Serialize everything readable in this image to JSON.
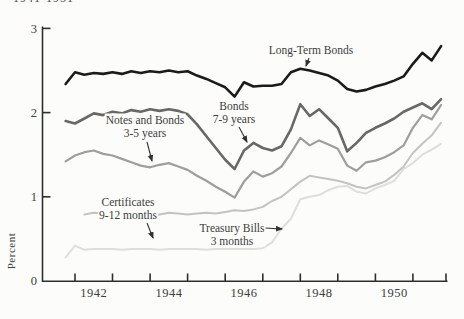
{
  "page": {
    "title_fragment": "1941-1951"
  },
  "chart_data": {
    "type": "line",
    "title": "1941-1951",
    "ylabel": "Percent",
    "ylim": [
      0,
      3
    ],
    "yticks": [
      0,
      1,
      2,
      3
    ],
    "xlim": [
      1941.6,
      1951.93
    ],
    "xticks": [
      1942,
      1943,
      1944,
      1945,
      1946,
      1947,
      1948,
      1949,
      1950,
      1951,
      1951.88
    ],
    "xtick_labels": [
      {
        "label": "1942",
        "center_year": 1942.5
      },
      {
        "label": "1944",
        "center_year": 1944.5
      },
      {
        "label": "1946",
        "center_year": 1946.5
      },
      {
        "label": "1948",
        "center_year": 1948.5
      },
      {
        "label": "1950",
        "center_year": 1950.5
      }
    ],
    "grid": false,
    "legend_position": "inline-annotations",
    "axis_color": "#2e2e2e",
    "series": [
      {
        "name": "Treasury Bills 3 months",
        "color": "#dedede",
        "width": 2.0,
        "x_start": 1941.75,
        "x_step": 0.25,
        "values": [
          0.28,
          0.42,
          0.37,
          0.38,
          0.38,
          0.38,
          0.37,
          0.38,
          0.38,
          0.38,
          0.37,
          0.38,
          0.38,
          0.38,
          0.38,
          0.37,
          0.38,
          0.38,
          0.38,
          0.38,
          0.38,
          0.39,
          0.46,
          0.62,
          0.74,
          0.97,
          1.0,
          1.02,
          1.08,
          1.12,
          1.13,
          1.06,
          1.04,
          1.1,
          1.14,
          1.19,
          1.33,
          1.4,
          1.5,
          1.56,
          1.63
        ]
      },
      {
        "name": "Certificates 9-12 months",
        "color": "#c3c3c3",
        "width": 2.0,
        "x_start": 1942.25,
        "x_step": 0.25,
        "values": [
          0.79,
          0.81,
          0.8,
          0.79,
          0.81,
          0.8,
          0.78,
          0.75,
          0.79,
          0.81,
          0.8,
          0.79,
          0.8,
          0.81,
          0.8,
          0.82,
          0.84,
          0.83,
          0.85,
          0.88,
          0.95,
          1.0,
          1.09,
          1.18,
          1.25,
          1.23,
          1.21,
          1.19,
          1.16,
          1.12,
          1.1,
          1.14,
          1.18,
          1.26,
          1.36,
          1.52,
          1.63,
          1.73,
          1.88
        ]
      },
      {
        "name": "Notes and Bonds 3-5 years",
        "color": "#9e9e9e",
        "width": 2.2,
        "x_start": 1941.75,
        "x_step": 0.25,
        "values": [
          1.42,
          1.49,
          1.53,
          1.55,
          1.51,
          1.49,
          1.45,
          1.41,
          1.37,
          1.35,
          1.38,
          1.4,
          1.36,
          1.32,
          1.25,
          1.19,
          1.12,
          1.06,
          0.99,
          1.18,
          1.3,
          1.24,
          1.28,
          1.36,
          1.52,
          1.7,
          1.61,
          1.67,
          1.62,
          1.57,
          1.37,
          1.31,
          1.41,
          1.43,
          1.47,
          1.53,
          1.61,
          1.82,
          1.97,
          1.92,
          2.09
        ]
      },
      {
        "name": "Bonds 7-9 years",
        "color": "#686868",
        "width": 2.6,
        "x_start": 1941.75,
        "x_step": 0.25,
        "values": [
          1.9,
          1.87,
          1.93,
          1.99,
          1.97,
          2.01,
          1.99,
          2.03,
          2.01,
          2.04,
          2.02,
          2.04,
          2.02,
          1.98,
          1.86,
          1.72,
          1.58,
          1.44,
          1.33,
          1.55,
          1.64,
          1.58,
          1.55,
          1.6,
          1.8,
          2.1,
          1.96,
          2.04,
          1.93,
          1.82,
          1.54,
          1.64,
          1.76,
          1.82,
          1.87,
          1.93,
          2.01,
          2.06,
          2.11,
          2.04,
          2.16
        ]
      },
      {
        "name": "Long-Term Bonds",
        "color": "#1b1b1b",
        "width": 2.6,
        "x_start": 1941.75,
        "x_step": 0.25,
        "values": [
          2.34,
          2.48,
          2.45,
          2.47,
          2.46,
          2.48,
          2.46,
          2.49,
          2.47,
          2.49,
          2.48,
          2.5,
          2.48,
          2.49,
          2.44,
          2.4,
          2.35,
          2.3,
          2.19,
          2.36,
          2.31,
          2.32,
          2.32,
          2.34,
          2.48,
          2.52,
          2.5,
          2.47,
          2.44,
          2.38,
          2.28,
          2.25,
          2.27,
          2.31,
          2.34,
          2.38,
          2.43,
          2.58,
          2.71,
          2.62,
          2.79
        ]
      }
    ],
    "annotations": [
      {
        "id": "long-term-bonds",
        "lines": [
          "Long-Term Bonds"
        ],
        "cx": 311,
        "cy": 50,
        "arrow": {
          "x1": 309,
          "y1": 58,
          "x2": 306,
          "y2": 66
        }
      },
      {
        "id": "bonds-7-9-years",
        "lines": [
          "Bonds",
          "7-9 years"
        ],
        "cx": 234,
        "cy": 112,
        "arrow": {
          "x1": 239,
          "y1": 127,
          "x2": 247,
          "y2": 142
        }
      },
      {
        "id": "notes-and-bonds-3-5-years",
        "lines": [
          "Notes and Bonds",
          "3-5 years"
        ],
        "cx": 145,
        "cy": 126,
        "arrow": {
          "x1": 147,
          "y1": 142,
          "x2": 152,
          "y2": 161
        }
      },
      {
        "id": "certificates-9-12-months",
        "lines": [
          "Certificates",
          "9-12 months"
        ],
        "cx": 128,
        "cy": 208,
        "arrow": {
          "x1": 147,
          "y1": 223,
          "x2": 153,
          "y2": 238
        }
      },
      {
        "id": "treasury-bills-3-months",
        "lines": [
          "Treasury Bills",
          "3 months"
        ],
        "cx": 232,
        "cy": 234,
        "arrow": {
          "x1": 265,
          "y1": 228,
          "x2": 282,
          "y2": 229
        }
      }
    ]
  }
}
